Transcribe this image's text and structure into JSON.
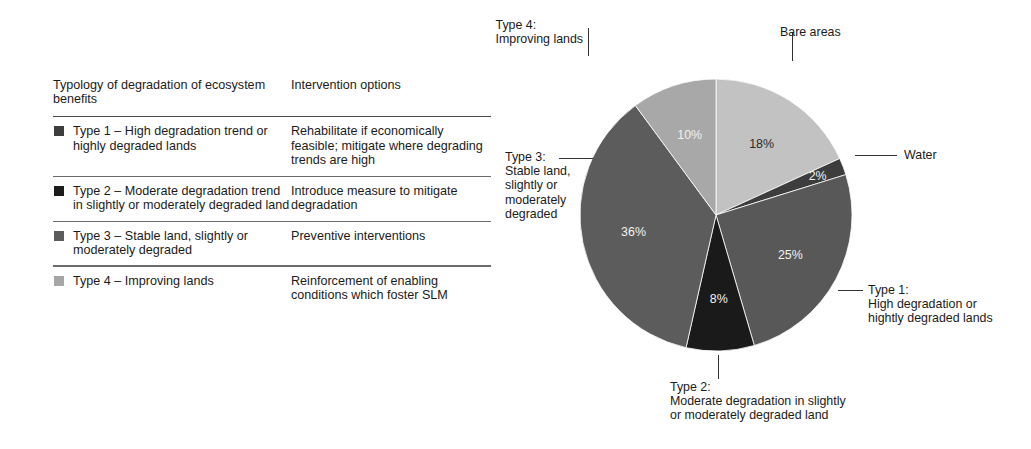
{
  "table": {
    "headers": {
      "typology": "Typology of degradation\nof ecosystem benefits",
      "intervention": "Intervention options"
    },
    "rows": [
      {
        "swatch_color": "#3d3d3d",
        "typology": "Type 1 – High degradation\ntrend or highly degraded\nlands",
        "intervention": "Rehabilitate if economically\nfeasible; mitigate where\ndegrading trends are high"
      },
      {
        "swatch_color": "#1c1c1c",
        "typology": "Type 2 – Moderate degradation\ntrend in slightly or moderately\ndegraded land",
        "intervention": "Introduce measure to mitigate\ndegradation"
      },
      {
        "swatch_color": "#5c5c5c",
        "typology": "Type 3 – Stable land, slightly\nor moderately degraded",
        "intervention": "Preventive interventions"
      },
      {
        "swatch_color": "#a6a6a6",
        "typology": "Type 4 – Improving lands",
        "intervention": "Reinforcement of enabling\nconditions which foster SLM"
      }
    ]
  },
  "chart_data": {
    "type": "pie",
    "title": "",
    "start_angle_deg": 0,
    "direction": "clockwise",
    "legend_position": "callouts",
    "categories": [
      "Bare areas",
      "Water",
      "Type 1",
      "Type 2",
      "Type 3",
      "Type 4"
    ],
    "values": [
      18,
      2,
      25,
      8,
      36,
      10
    ],
    "value_labels": [
      "18%",
      "2%",
      "25%",
      "8%",
      "36%",
      "10%"
    ],
    "colors": [
      "#c2c2c2",
      "#3d3d3d",
      "#585858",
      "#1a1a1a",
      "#5c5c5c",
      "#a8a8a8"
    ],
    "slices": [
      {
        "name": "Bare areas",
        "value": 18,
        "label": "18%",
        "color": "#c2c2c2",
        "label_fill": "dark"
      },
      {
        "name": "Water",
        "value": 2,
        "label": "2%",
        "color": "#3d3d3d",
        "label_fill": "light"
      },
      {
        "name": "Type 1",
        "value": 25,
        "label": "25%",
        "color": "#585858",
        "label_fill": "light"
      },
      {
        "name": "Type 2",
        "value": 8,
        "label": "8%",
        "color": "#1a1a1a",
        "label_fill": "light"
      },
      {
        "name": "Type 3",
        "value": 36,
        "label": "36%",
        "color": "#5c5c5c",
        "label_fill": "light"
      },
      {
        "name": "Type 4",
        "value": 10,
        "label": "10%",
        "color": "#a8a8a8",
        "label_fill": "light"
      }
    ]
  },
  "callouts": {
    "type4": "Type 4:\nImproving lands",
    "bare_areas": "Bare areas",
    "water": "Water",
    "type1": "Type 1:\nHigh degradation or\nhightly degraded lands",
    "type2": "Type 2:\nModerate degradation in slightly\nor moderately degraded land",
    "type3": "Type 3:\nStable land,\nslightly or\nmoderately\ndegraded"
  }
}
